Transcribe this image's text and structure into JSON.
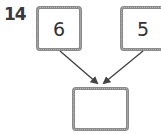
{
  "question_number": "14",
  "boxes": {
    "top_left": "6",
    "top_right": "5",
    "bottom": ""
  },
  "colors": {
    "border": "#7a7a7a",
    "arrow": "#444444",
    "text": "#333333"
  }
}
